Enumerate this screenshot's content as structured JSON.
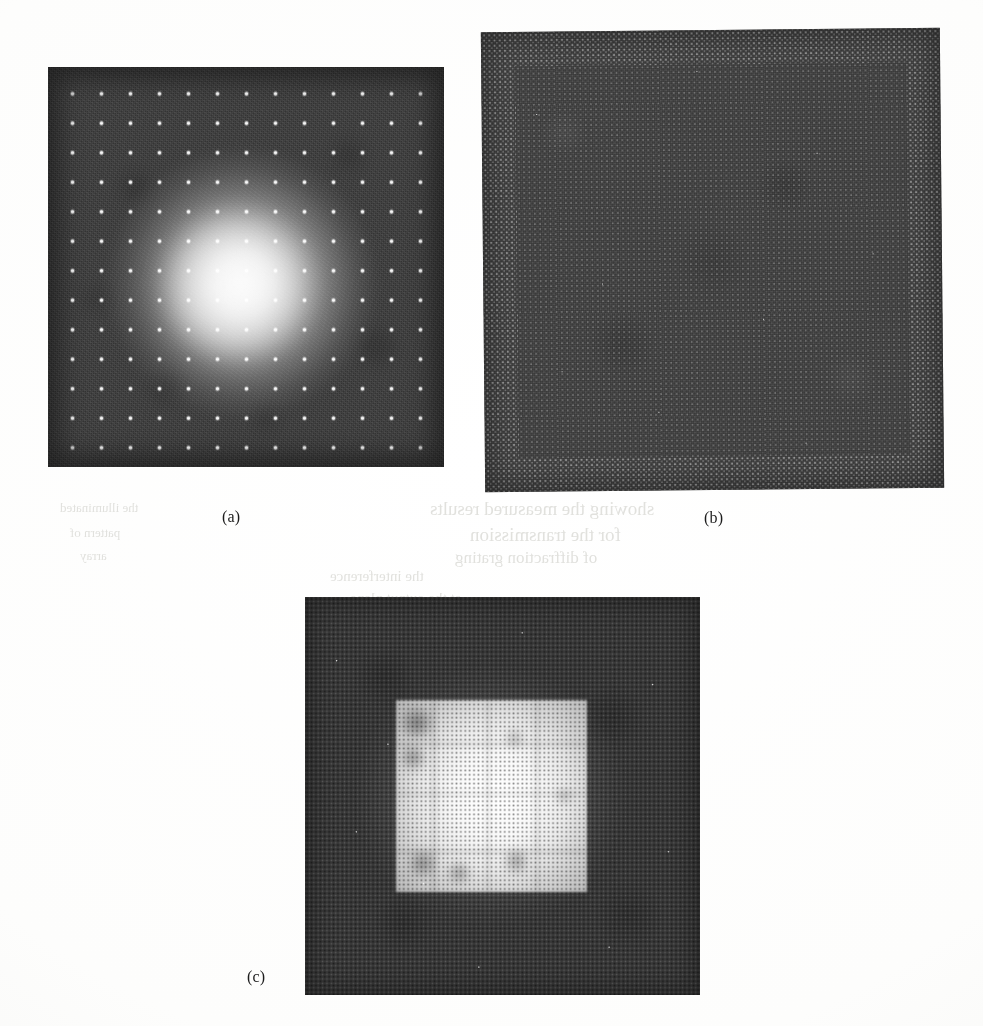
{
  "page": {
    "width": 983,
    "height": 1026,
    "background_color": "#fbfbfa",
    "kind": "scanned figure plate"
  },
  "figure": {
    "labels": {
      "a": "(a)",
      "b": "(b)",
      "c": "(c)"
    },
    "panels": [
      {
        "id": "a",
        "label": "(a)",
        "description": "Dark square photograph showing a bright diffuse central glow overlaid by a regular square array of small bright spots.",
        "x": 48,
        "y": 67,
        "width": 396,
        "height": 400,
        "field_color": "#3b3b3b",
        "spot_color": "#ffffff",
        "spot_grid_cols": 10,
        "spot_grid_rows": 10,
        "spot_spacing_px": 29
      },
      {
        "id": "b",
        "label": "(b)",
        "description": "Uniform dark square photograph with a dense fine dot-matrix (halftone) texture across the whole field and a brighter matrix rim.",
        "x": 483,
        "y": 30,
        "width": 459,
        "height": 460,
        "field_color": "#404040",
        "matrix_dot_color": "#ebebeb",
        "matrix_spacing_px": 5.2,
        "rotation_deg": -0.55
      },
      {
        "id": "c",
        "label": "(c)",
        "description": "Dark halftone square photograph containing a bright near-white square window slightly right of centre, with faint internal band divisions and darker corner blotches.",
        "x": 305,
        "y": 597,
        "width": 395,
        "height": 398,
        "field_color": "#383838",
        "window_color": "#ffffff",
        "window_x_pct": 23,
        "window_y_pct": 26,
        "window_width_pct": 48.5,
        "window_height_pct": 48,
        "halftone_spacing_px": 4.4
      }
    ],
    "label_positions": {
      "a": {
        "x": 222,
        "y": 508
      },
      "b": {
        "x": 704,
        "y": 509
      },
      "c": {
        "x": 247,
        "y": 968
      }
    }
  },
  "bleed_through": {
    "note": "Faint mirror-image show-through text from the reverse side of the scanned page.",
    "color": "#dcdcd8",
    "lines": [
      {
        "text": "showing the measured results",
        "x": 430,
        "y": 498,
        "size": 19
      },
      {
        "text": "for the transmission",
        "x": 470,
        "y": 524,
        "size": 19
      },
      {
        "text": "of diffraction grating",
        "x": 455,
        "y": 548,
        "size": 17
      },
      {
        "text": "the illuminated",
        "x": 60,
        "y": 500,
        "size": 13
      },
      {
        "text": "pattern of",
        "x": 70,
        "y": 525,
        "size": 13
      },
      {
        "text": "array",
        "x": 80,
        "y": 548,
        "size": 13
      },
      {
        "text": "the interference",
        "x": 330,
        "y": 568,
        "size": 15
      },
      {
        "text": "at the output plane",
        "x": 350,
        "y": 590,
        "size": 15
      }
    ]
  }
}
